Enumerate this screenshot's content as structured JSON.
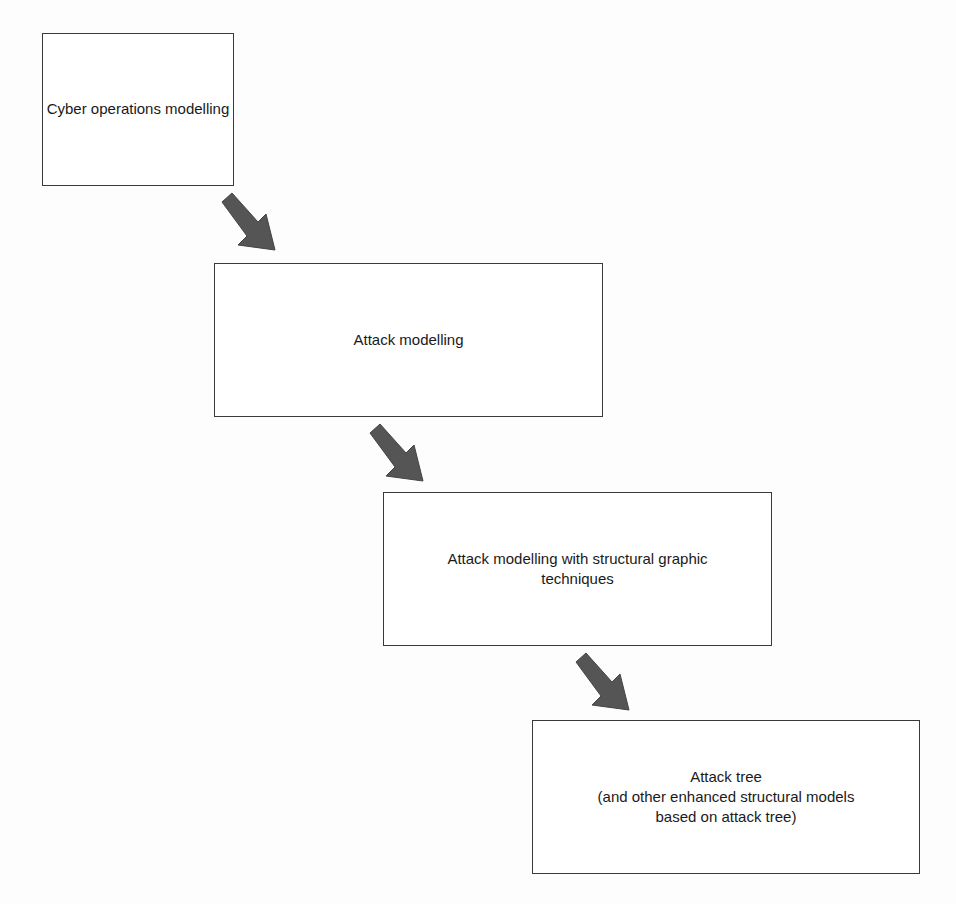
{
  "diagram": {
    "title": "",
    "nodes": [
      {
        "id": "n1",
        "label": "Cyber operations modelling"
      },
      {
        "id": "n2",
        "label": "Attack modelling"
      },
      {
        "id": "n3",
        "label": "Attack modelling with structural graphic\ntechniques"
      },
      {
        "id": "n4",
        "label": "Attack tree\n(and other enhanced structural models\nbased on attack tree)"
      }
    ],
    "edges": [
      {
        "from": "n1",
        "to": "n2"
      },
      {
        "from": "n2",
        "to": "n3"
      },
      {
        "from": "n3",
        "to": "n4"
      }
    ],
    "colors": {
      "box_border": "#3a3a3a",
      "arrow_fill": "#555555",
      "background": "#fdfdfd"
    }
  }
}
